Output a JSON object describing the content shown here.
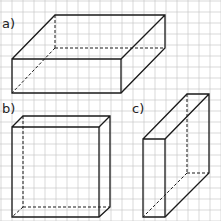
{
  "labels": {
    "a": "a)",
    "b": "b)",
    "c": "c)"
  },
  "grid": {
    "spacing": 11,
    "color": "#c8c8c8"
  },
  "line_color": "#1a1a1a",
  "figures": [
    {
      "id": "a",
      "shape": "cuboid",
      "description": "flat wide box"
    },
    {
      "id": "b",
      "shape": "cuboid",
      "description": "tall box, shallow depth"
    },
    {
      "id": "c",
      "shape": "cuboid",
      "description": "narrow box, deep"
    }
  ]
}
